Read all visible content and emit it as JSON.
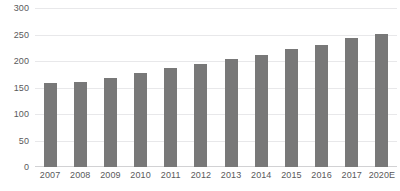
{
  "chart_data": {
    "type": "bar",
    "title": "",
    "subtitle": "",
    "xlabel": "",
    "ylabel": "",
    "categories": [
      "2007",
      "2008",
      "2009",
      "2010",
      "2011",
      "2012",
      "2013",
      "2014",
      "2015",
      "2016",
      "2017",
      "2020E"
    ],
    "values": [
      158,
      160,
      168,
      177,
      186,
      195,
      203,
      212,
      222,
      231,
      243,
      251
    ],
    "series": [
      {
        "name": "",
        "values": [
          158,
          160,
          168,
          177,
          186,
          195,
          203,
          212,
          222,
          231,
          243,
          251
        ]
      }
    ],
    "ylim": [
      0,
      300
    ],
    "y_ticks": [
      0,
      50,
      100,
      150,
      200,
      250,
      300
    ],
    "y_tick_labels": [
      "0",
      "50",
      "100",
      "150",
      "200",
      "250",
      "300"
    ],
    "grid": true,
    "grid_axis": "y",
    "legend": false,
    "legend_position": "none",
    "annotations": [],
    "bar_color": "#787878",
    "gridline_color": "#e8e8ea",
    "axis_line_color": "#d2d2d4",
    "tick_label_color": "#59595b",
    "background_color": "#ffffff"
  }
}
